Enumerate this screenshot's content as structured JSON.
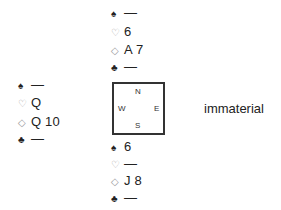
{
  "north": {
    "spades": {
      "symbol": "♠",
      "cards": "—"
    },
    "hearts": {
      "symbol": "♡",
      "cards": "6"
    },
    "diamonds": {
      "symbol": "◇",
      "cards": "A 7"
    },
    "clubs": {
      "symbol": "♣",
      "cards": "—"
    }
  },
  "west": {
    "spades": {
      "symbol": "♠",
      "cards": "—"
    },
    "hearts": {
      "symbol": "♡",
      "cards": "Q"
    },
    "diamonds": {
      "symbol": "◇",
      "cards": "Q 10"
    },
    "clubs": {
      "symbol": "♣",
      "cards": "—"
    }
  },
  "east": {
    "note": "immaterial"
  },
  "south": {
    "spades": {
      "symbol": "♠",
      "cards": "6"
    },
    "hearts": {
      "symbol": "♡",
      "cards": "—"
    },
    "diamonds": {
      "symbol": "◇",
      "cards": "J 8"
    },
    "clubs": {
      "symbol": "♣",
      "cards": "—"
    }
  },
  "compass": {
    "n": "N",
    "e": "E",
    "s": "S",
    "w": "W"
  }
}
